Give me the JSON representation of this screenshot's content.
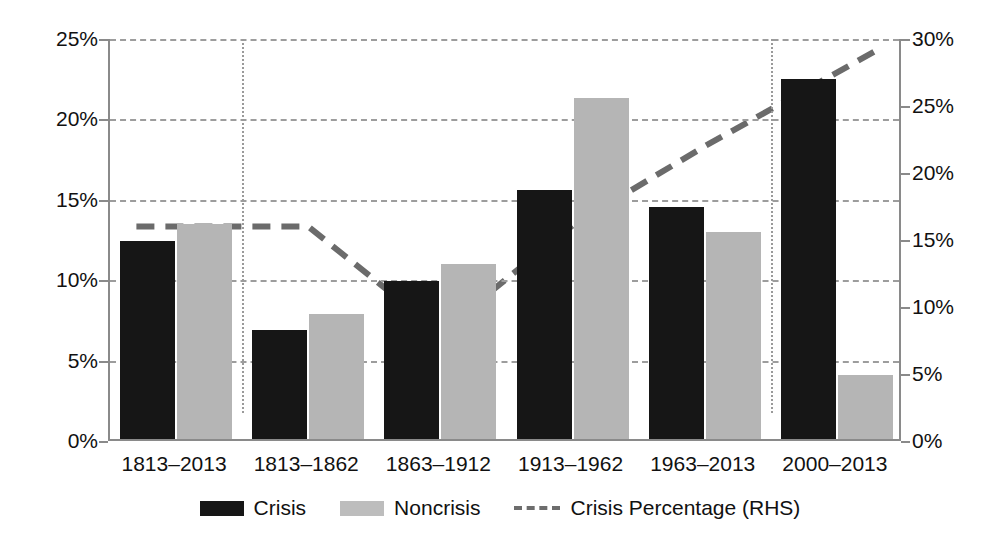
{
  "chart_data": {
    "type": "bar",
    "title": "",
    "xlabel": "",
    "ylabel": "",
    "categories": [
      "1813–2013",
      "1813–1862",
      "1863–1912",
      "1913–1962",
      "1963–2013",
      "2000–2013"
    ],
    "series": [
      {
        "name": "Crisis",
        "axis": "left",
        "values": [
          12.3,
          6.8,
          9.8,
          15.5,
          14.4,
          22.4
        ]
      },
      {
        "name": "Noncrisis",
        "axis": "left",
        "values": [
          13.4,
          7.8,
          10.9,
          21.2,
          12.9,
          4.0
        ]
      },
      {
        "name": "Crisis Percentage (RHS)",
        "axis": "right",
        "type": "line",
        "values": [
          16.0,
          16.0,
          8.1,
          16.1,
          22.0,
          27.5
        ]
      }
    ],
    "left_axis": {
      "min": 0,
      "max": 25,
      "step": 5,
      "ticks": [
        "0%",
        "5%",
        "10%",
        "15%",
        "20%",
        "25%"
      ]
    },
    "right_axis": {
      "min": 0,
      "max": 30,
      "step": 5,
      "ticks": [
        "0%",
        "5%",
        "10%",
        "15%",
        "20%",
        "25%",
        "30%"
      ]
    },
    "grid": true,
    "legend_position": "bottom",
    "legend": [
      "Crisis",
      "Noncrisis",
      "Crisis Percentage (RHS)"
    ],
    "annotations": {
      "vertical_dotted_lines": [
        "1813–1862 boundary",
        "2000–2013 boundary"
      ]
    }
  },
  "legend": {
    "crisis_label": "Crisis",
    "noncrisis_label": "Noncrisis",
    "line_label": "Crisis Percentage (RHS)"
  }
}
